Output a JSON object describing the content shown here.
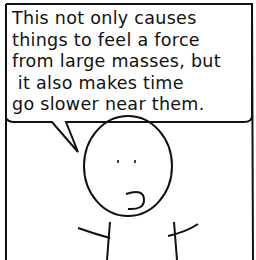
{
  "panel": {
    "speech": {
      "lines": [
        "This not only causes",
        "things to feel a force",
        "from large masses, but",
        " it also makes time",
        "go slower near them."
      ]
    },
    "character": "stick-figure-speaking"
  }
}
